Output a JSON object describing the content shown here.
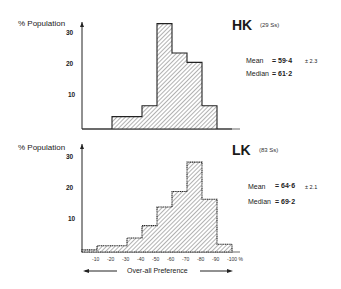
{
  "chart_data": [
    {
      "type": "bar",
      "title": "HK",
      "subtitle": "(29 Ss)",
      "ylabel": "% Population",
      "xlabel": "Over-all Preference",
      "ylim": [
        0,
        35
      ],
      "yticks": [
        "10",
        "20",
        "30"
      ],
      "categories": [
        "0 to -10",
        "-10 to -20",
        "-20 to -30",
        "-30 to -40",
        "-40 to -50",
        "-50 to -60",
        "-60 to -70",
        "-70 to -80",
        "-80 to -90",
        "-90 to -100"
      ],
      "values": [
        0,
        0,
        4,
        4,
        7.5,
        34,
        24.5,
        21.5,
        7.5,
        0
      ],
      "stats": {
        "mean_label": "Mean",
        "mean": "= 59·4",
        "mean_err": "± 2.3",
        "median_label": "Median",
        "median": "= 61·2"
      }
    },
    {
      "type": "bar",
      "title": "LK",
      "subtitle": "(83 Ss)",
      "ylabel": "% Population",
      "xlabel": "Over-all Preference",
      "ylim": [
        0,
        35
      ],
      "yticks": [
        "10",
        "20",
        "30"
      ],
      "xticks": [
        "-10",
        "-20",
        "-30",
        "-40",
        "-50",
        "-60",
        "-70",
        "-80",
        "-90",
        "-100 %"
      ],
      "categories": [
        "0 to -10",
        "-10 to -20",
        "-20 to -30",
        "-30 to -40",
        "-40 to -50",
        "-50 to -60",
        "-60 to -70",
        "-70 to -80",
        "-80 to -90",
        "-90 to -100"
      ],
      "values": [
        0.7,
        2,
        2,
        4.5,
        8.5,
        14.5,
        19.5,
        29,
        17,
        2.5
      ],
      "stats": {
        "mean_label": "Mean",
        "mean": "= 64·6",
        "mean_err": "± 2.1",
        "median_label": "Median",
        "median": "= 69·2"
      }
    }
  ],
  "labels": {
    "ylabel": "% Population",
    "xlabel": "Over-all Preference"
  }
}
